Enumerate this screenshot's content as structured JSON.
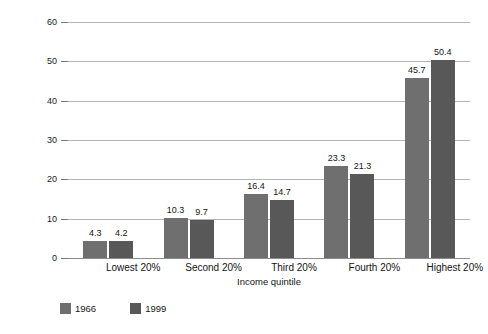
{
  "chart_data": {
    "type": "bar",
    "title": "",
    "subtitle": "",
    "xlabel": "Income quintile",
    "ylabel": "Percentage of total family income",
    "categories": [
      "Lowest 20%",
      "Second 20%",
      "Third 20%",
      "Fourth 20%",
      "Highest 20%"
    ],
    "series": [
      {
        "name": "1966",
        "color": "#6f6f6f",
        "values": [
          4.3,
          10.3,
          16.4,
          23.3,
          45.7
        ]
      },
      {
        "name": "1999",
        "color": "#585858",
        "values": [
          4.2,
          9.7,
          14.7,
          21.3,
          50.4
        ]
      }
    ],
    "ylim": [
      0,
      60
    ],
    "yticks": [
      0,
      10,
      20,
      30,
      40,
      50,
      60
    ],
    "ytick_labels": [
      "0",
      "10",
      "20",
      "30",
      "40",
      "50",
      "60"
    ],
    "grid": "horizontal",
    "legend_position": "bottom-left",
    "value_labels": true,
    "value_labels_text": {
      "s0": [
        "4.3",
        "10.3",
        "16.4",
        "23.3",
        "45.7"
      ],
      "s1": [
        "4.2",
        "9.7",
        "14.7",
        "21.3",
        "50.4"
      ]
    },
    "colors": {
      "background": "#ffffff",
      "gridline": "#b4b4b4",
      "axis": "#8c8c8c",
      "text": "#151515",
      "series_1966": "#6f6f6f",
      "series_1999": "#585858"
    }
  },
  "legend": {
    "items": [
      {
        "label": "1966",
        "color": "#6f6f6f"
      },
      {
        "label": "1999",
        "color": "#585858"
      }
    ]
  }
}
